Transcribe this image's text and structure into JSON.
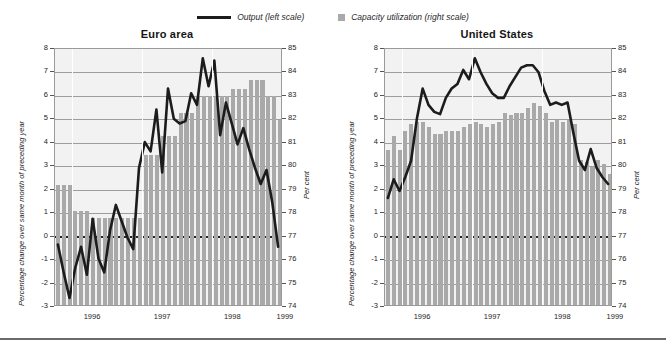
{
  "legend": {
    "output": {
      "label": "Output (left scale)",
      "icon": "line-swatch",
      "color": "#1c1c1c"
    },
    "capacity": {
      "label": "Capacity utilization (right scale)",
      "icon": "square-swatch",
      "color": "#a9a9a9"
    }
  },
  "axis": {
    "left_label": "Percentage change over same month of preceding year",
    "right_label": "Per cent",
    "left_ticks": [
      "8",
      "7",
      "6",
      "5",
      "4",
      "3",
      "2",
      "1",
      "0",
      "-1",
      "-2",
      "-3"
    ],
    "right_ticks": [
      "85",
      "84",
      "83",
      "82",
      "81",
      "80",
      "79",
      "78",
      "77",
      "76",
      "75",
      "74"
    ],
    "x_ticks": [
      "1996",
      "1997",
      "1998",
      "1999"
    ]
  },
  "chart_data": [
    {
      "type": "bar",
      "id": "euro-area",
      "title": "Euro area",
      "xlabel": "",
      "ylabel": "Percentage change over same month of preceding year",
      "y2label": "Per cent",
      "ylim": [
        -3,
        8
      ],
      "y2lim": [
        74,
        85
      ],
      "grid": true,
      "legend_position": "top-center",
      "x_tick_labels": [
        "1996",
        "1997",
        "1998",
        "1999"
      ],
      "x_tick_positions": [
        6,
        18,
        30,
        39
      ],
      "x_start": "1995-10",
      "x_end": "1998-12",
      "x_months": [
        "1995-10",
        "1995-11",
        "1995-12",
        "1996-01",
        "1996-02",
        "1996-03",
        "1996-04",
        "1996-05",
        "1996-06",
        "1996-07",
        "1996-08",
        "1996-09",
        "1996-10",
        "1996-11",
        "1996-12",
        "1997-01",
        "1997-02",
        "1997-03",
        "1997-04",
        "1997-05",
        "1997-06",
        "1997-07",
        "1997-08",
        "1997-09",
        "1997-10",
        "1997-11",
        "1997-12",
        "1998-01",
        "1998-02",
        "1998-03",
        "1998-04",
        "1998-05",
        "1998-06",
        "1998-07",
        "1998-08",
        "1998-09",
        "1998-10",
        "1998-11",
        "1998-12"
      ],
      "series": [
        {
          "name": "Capacity utilization (right scale)",
          "axis": "right",
          "render": "bar",
          "color": "#a9a9a9",
          "values": [
            79.1,
            79.1,
            79.1,
            78.0,
            78.0,
            78.0,
            77.7,
            77.7,
            77.7,
            77.7,
            77.7,
            77.7,
            77.7,
            77.7,
            77.7,
            80.4,
            80.4,
            80.4,
            81.2,
            81.2,
            81.2,
            82.2,
            82.2,
            82.2,
            82.9,
            82.9,
            82.9,
            82.9,
            82.9,
            82.9,
            83.2,
            83.2,
            83.2,
            83.6,
            83.6,
            83.6,
            82.9,
            82.9,
            81.9
          ]
        },
        {
          "name": "Output (left scale)",
          "axis": "left",
          "render": "line",
          "color": "#1c1c1c",
          "values": [
            -0.4,
            -1.6,
            -2.7,
            -1.4,
            -0.5,
            -1.7,
            0.7,
            -1.0,
            -1.6,
            0.2,
            1.3,
            0.6,
            -0.1,
            -0.6,
            2.9,
            4.0,
            3.6,
            5.4,
            2.7,
            6.3,
            5.0,
            4.8,
            4.9,
            6.1,
            5.6,
            7.6,
            6.4,
            7.5,
            4.3,
            5.7,
            4.8,
            3.9,
            4.6,
            3.7,
            2.9,
            2.2,
            2.8,
            1.4,
            -0.5
          ]
        }
      ]
    },
    {
      "type": "bar",
      "id": "united-states",
      "title": "United States",
      "xlabel": "",
      "ylabel": "Percentage change over same month of preceding year",
      "y2label": "Per cent",
      "ylim": [
        -3,
        8
      ],
      "y2lim": [
        74,
        85
      ],
      "grid": true,
      "legend_position": "top-center",
      "x_tick_labels": [
        "1996",
        "1997",
        "1998",
        "1999"
      ],
      "x_tick_positions": [
        6,
        18,
        30,
        39
      ],
      "x_start": "1995-10",
      "x_end": "1998-12",
      "x_months": [
        "1995-10",
        "1995-11",
        "1995-12",
        "1996-01",
        "1996-02",
        "1996-03",
        "1996-04",
        "1996-05",
        "1996-06",
        "1996-07",
        "1996-08",
        "1996-09",
        "1996-10",
        "1996-11",
        "1996-12",
        "1997-01",
        "1997-02",
        "1997-03",
        "1997-04",
        "1997-05",
        "1997-06",
        "1997-07",
        "1997-08",
        "1997-09",
        "1997-10",
        "1997-11",
        "1997-12",
        "1998-01",
        "1998-02",
        "1998-03",
        "1998-04",
        "1998-05",
        "1998-06",
        "1998-07",
        "1998-08",
        "1998-09",
        "1998-10",
        "1998-11",
        "1998-12"
      ],
      "series": [
        {
          "name": "Capacity utilization (right scale)",
          "axis": "right",
          "render": "bar",
          "color": "#a9a9a9",
          "values": [
            80.6,
            81.2,
            80.6,
            81.4,
            81.7,
            81.8,
            81.8,
            81.6,
            81.3,
            81.3,
            81.4,
            81.4,
            81.4,
            81.6,
            81.7,
            81.8,
            81.7,
            81.6,
            81.7,
            81.8,
            82.2,
            82.1,
            82.2,
            82.2,
            82.4,
            82.6,
            82.5,
            82.2,
            81.8,
            81.9,
            81.8,
            81.9,
            81.7,
            80.2,
            80.1,
            79.9,
            80.2,
            80.0,
            79.6
          ]
        },
        {
          "name": "Output (left scale)",
          "axis": "left",
          "render": "line",
          "color": "#1c1c1c",
          "values": [
            1.6,
            2.4,
            1.9,
            2.5,
            3.2,
            5.0,
            6.3,
            5.6,
            5.3,
            5.2,
            5.9,
            6.3,
            6.5,
            7.1,
            6.7,
            7.6,
            7.0,
            6.5,
            6.1,
            5.9,
            5.9,
            6.4,
            6.8,
            7.2,
            7.3,
            7.3,
            7.0,
            6.2,
            5.6,
            5.7,
            5.6,
            5.7,
            4.4,
            3.2,
            2.8,
            3.7,
            2.9,
            2.5,
            2.2
          ]
        }
      ]
    }
  ]
}
